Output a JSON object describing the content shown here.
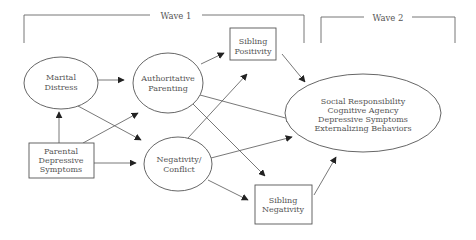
{
  "diagram": {
    "type": "path-model",
    "waves": [
      {
        "id": "wave1",
        "label": "Wave 1"
      },
      {
        "id": "wave2",
        "label": "Wave 2"
      }
    ],
    "nodes": [
      {
        "id": "marital_distress",
        "shape": "ellipse",
        "wave": "wave1",
        "lines": [
          "Marital",
          "Distress"
        ]
      },
      {
        "id": "parental_depressive",
        "shape": "rect",
        "wave": "wave1",
        "lines": [
          "Parental",
          "Depressive",
          "Symptoms"
        ]
      },
      {
        "id": "authoritative_parenting",
        "shape": "ellipse",
        "wave": "wave1",
        "lines": [
          "Authoritative",
          "Parenting"
        ]
      },
      {
        "id": "negativity_conflict",
        "shape": "ellipse",
        "wave": "wave1",
        "lines": [
          "Negativity/",
          "Conflict"
        ]
      },
      {
        "id": "sibling_positivity",
        "shape": "rect",
        "wave": "wave1",
        "lines": [
          "Sibling",
          "Positivity"
        ]
      },
      {
        "id": "sibling_negativity",
        "shape": "rect",
        "wave": "wave1",
        "lines": [
          "Sibling",
          "Negativity"
        ]
      },
      {
        "id": "outcomes",
        "shape": "ellipse",
        "wave": "wave2",
        "lines": [
          "Social Responsibility",
          "Cognitive Agency",
          "Depressive Symptoms",
          "Externalizing Behaviors"
        ]
      }
    ],
    "edges": [
      {
        "from": "parental_depressive",
        "to": "marital_distress"
      },
      {
        "from": "parental_depressive",
        "to": "authoritative_parenting"
      },
      {
        "from": "parental_depressive",
        "to": "negativity_conflict"
      },
      {
        "from": "marital_distress",
        "to": "authoritative_parenting"
      },
      {
        "from": "marital_distress",
        "to": "negativity_conflict"
      },
      {
        "from": "authoritative_parenting",
        "to": "sibling_positivity"
      },
      {
        "from": "authoritative_parenting",
        "to": "outcomes"
      },
      {
        "from": "authoritative_parenting",
        "to": "sibling_negativity"
      },
      {
        "from": "negativity_conflict",
        "to": "sibling_positivity"
      },
      {
        "from": "negativity_conflict",
        "to": "outcomes"
      },
      {
        "from": "negativity_conflict",
        "to": "sibling_negativity"
      },
      {
        "from": "sibling_positivity",
        "to": "outcomes"
      },
      {
        "from": "sibling_negativity",
        "to": "outcomes"
      }
    ]
  }
}
